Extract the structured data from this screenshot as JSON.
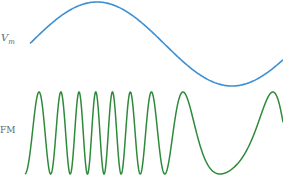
{
  "labels": {
    "message_symbol": "V",
    "message_subscript": "m",
    "fm_label": "FM"
  },
  "colors": {
    "message_wave": "#3d8fd1",
    "fm_wave": "#2e8a3a",
    "label": "#5a6a72",
    "background": "#ffffff"
  },
  "message_wave": {
    "type": "sine",
    "start": [
      30,
      44
    ],
    "peak": [
      97,
      2
    ],
    "trough": [
      232,
      86
    ],
    "end": [
      283,
      44
    ]
  },
  "fm_wave": {
    "center_y": 133,
    "amplitude": 41,
    "x_start": 25,
    "x_end": 283,
    "note": "frequency highest near message peak, lowest near message trough"
  }
}
